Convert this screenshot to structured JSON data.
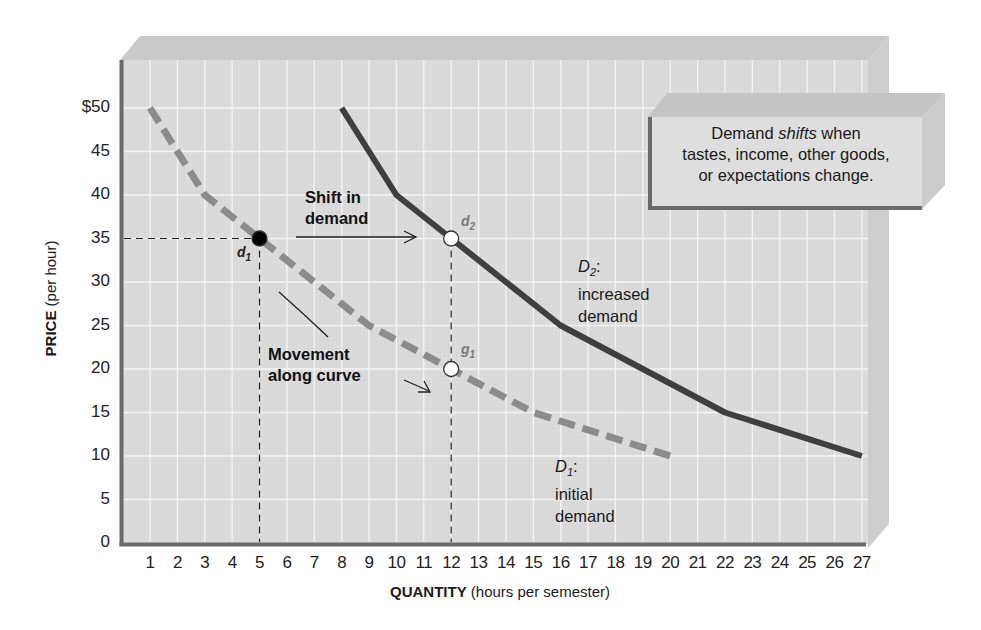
{
  "chart_data": {
    "type": "line",
    "title": "",
    "xlabel": "QUANTITY (hours per semester)",
    "xlabel_bold": "QUANTITY",
    "xlabel_rest": "(hours per semester)",
    "ylabel": "PRICE (per hour)",
    "ylabel_bold": "PRICE",
    "ylabel_rest": "(per hour)",
    "xlim": [
      0,
      27
    ],
    "ylim": [
      0,
      55
    ],
    "grid": true,
    "x_ticks": [
      "1",
      "2",
      "3",
      "4",
      "5",
      "6",
      "7",
      "8",
      "9",
      "10",
      "11",
      "12",
      "13",
      "14",
      "15",
      "16",
      "17",
      "18",
      "19",
      "20",
      "21",
      "22",
      "23",
      "24",
      "25",
      "26",
      "27"
    ],
    "y_ticks": [
      "0",
      "5",
      "10",
      "15",
      "20",
      "25",
      "30",
      "35",
      "40",
      "45",
      "$50"
    ],
    "series": [
      {
        "name": "D1: initial demand",
        "label_main": "D",
        "label_sub": "1",
        "label_line1": "initial",
        "label_line2": "demand",
        "style": "dashed",
        "color": "#8c8c8c",
        "points": [
          [
            1,
            50
          ],
          [
            3,
            40
          ],
          [
            5,
            35
          ],
          [
            9,
            25
          ],
          [
            12,
            20
          ],
          [
            15,
            15
          ],
          [
            20,
            10
          ]
        ]
      },
      {
        "name": "D2: increased demand",
        "label_main": "D",
        "label_sub": "2",
        "label_line1": "increased",
        "label_line2": "demand",
        "style": "solid",
        "color": "#3f3f3f",
        "points": [
          [
            8,
            50
          ],
          [
            10,
            40
          ],
          [
            12,
            35
          ],
          [
            16,
            25
          ],
          [
            22,
            15
          ],
          [
            27,
            10
          ]
        ]
      }
    ],
    "marked_points": [
      {
        "id": "d1",
        "letter": "d",
        "sub": "1",
        "x": 5,
        "y": 35,
        "fill": "#000000"
      },
      {
        "id": "d2",
        "letter": "d",
        "sub": "2",
        "x": 12,
        "y": 35,
        "fill": "#ffffff"
      },
      {
        "id": "g1",
        "letter": "g",
        "sub": "1",
        "x": 12,
        "y": 20,
        "fill": "#ffffff"
      }
    ],
    "annotations": [
      {
        "id": "shift",
        "line1": "Shift in",
        "line2": "demand"
      },
      {
        "id": "movement",
        "line1": "Movement",
        "line2": "along curve"
      }
    ],
    "callout": {
      "pre": "Demand ",
      "em": "shifts",
      "post": " when",
      "line2": "tastes, income, other goods,",
      "line3": "or expectations change."
    }
  },
  "colors": {
    "panel": "#d9d9d9",
    "panel_top": "#c8c8c8",
    "panel_side": "#cfcfcf",
    "grid": "#f2f2f2",
    "axis": "#6a6a6a",
    "d1": "#8c8c8c",
    "d2": "#3f3f3f"
  }
}
